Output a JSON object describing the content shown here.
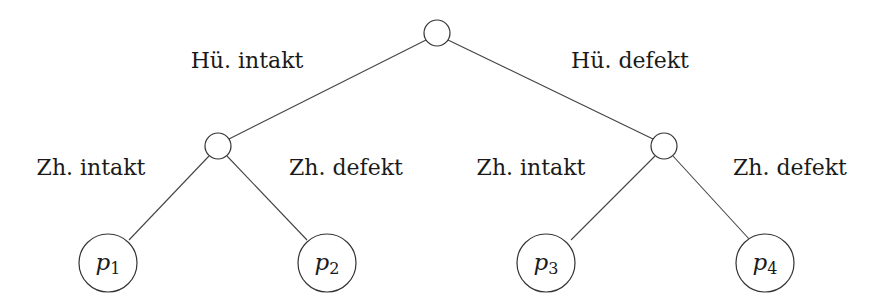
{
  "diagram": {
    "type": "probability-tree",
    "root": {
      "label": ""
    },
    "level1_edges": [
      {
        "label": "Hü. intakt"
      },
      {
        "label": "Hü. defekt"
      }
    ],
    "level2_edges": [
      {
        "label": "Zh. intakt"
      },
      {
        "label": "Zh. defekt"
      },
      {
        "label": "Zh. intakt"
      },
      {
        "label": "Zh. defekt"
      }
    ],
    "leaves": [
      {
        "symbol": "p",
        "index": "1"
      },
      {
        "symbol": "p",
        "index": "2"
      },
      {
        "symbol": "p",
        "index": "3"
      },
      {
        "symbol": "p",
        "index": "4"
      }
    ]
  }
}
